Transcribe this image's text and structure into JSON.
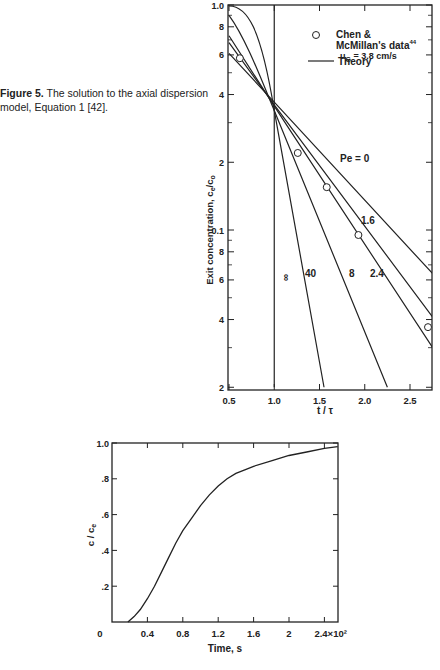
{
  "caption": {
    "label": "Figure 5.",
    "text": "The solution to the axial dispersion model, Equation 1 [42]."
  },
  "chart_data": [
    {
      "type": "line",
      "title": "",
      "xlabel": "t/τ",
      "ylabel": "Exit concentration, c_e/c_o",
      "xlim": [
        0.5,
        2.75
      ],
      "ylim": [
        0.02,
        1.0
      ],
      "yscale": "log",
      "x_ticks": [
        "0.5",
        "1.0",
        "1.5",
        "2.0",
        "2.5"
      ],
      "y_ticks": [
        "1.0",
        "8",
        "6",
        "4",
        "2",
        "0.1",
        "8",
        "6",
        "4",
        "2"
      ],
      "legend": {
        "marker_label": "Chen & McMillan's data",
        "marker_superscript": "44",
        "condition": "u_G = 3.8 cm/s",
        "line_label": "Theory"
      },
      "series": [
        {
          "name": "Pe=0",
          "label": "Pe = 0",
          "x": [
            0.5,
            1.0,
            2.75
          ],
          "y": [
            0.61,
            0.37,
            0.064
          ]
        },
        {
          "name": "Pe=1.6",
          "label": "1.6",
          "x": [
            0.5,
            1.0,
            2.75
          ],
          "y": [
            0.68,
            0.36,
            0.041
          ]
        },
        {
          "name": "Pe=2.4",
          "label": "2.4",
          "x": [
            0.5,
            1.0,
            2.75
          ],
          "y": [
            0.73,
            0.355,
            0.03
          ]
        },
        {
          "name": "Pe=8",
          "label": "8",
          "x": [
            0.5,
            1.0,
            2.25
          ],
          "y": [
            0.9,
            0.34,
            0.02
          ]
        },
        {
          "name": "Pe=40",
          "label": "40",
          "x": [
            0.5,
            0.8,
            1.0,
            1.55
          ],
          "y": [
            0.99,
            0.8,
            0.34,
            0.02
          ]
        },
        {
          "name": "Pe=inf",
          "label": "∞",
          "x": [
            1.0,
            1.0
          ],
          "y": [
            1.0,
            0.02
          ]
        }
      ],
      "data_points": {
        "name": "Chen & McMillan's data",
        "x": [
          0.62,
          1.26,
          1.58,
          1.93,
          2.72
        ],
        "y": [
          0.58,
          0.22,
          0.155,
          0.095,
          0.037
        ]
      }
    },
    {
      "type": "line",
      "title": "",
      "xlabel": "Time, s",
      "ylabel": "c/c_e",
      "xlim": [
        0,
        2.55
      ],
      "ylim": [
        0,
        1.0
      ],
      "x_ticks": [
        "0",
        "0.4",
        "0.8",
        "1.2",
        "1.6",
        "2",
        "2.4×10²"
      ],
      "y_ticks": [
        ".2",
        ".4",
        ".6",
        ".8",
        "1.0"
      ],
      "series": [
        {
          "name": "response",
          "x": [
            0.18,
            0.25,
            0.32,
            0.4,
            0.48,
            0.56,
            0.64,
            0.72,
            0.8,
            0.9,
            1.0,
            1.1,
            1.2,
            1.3,
            1.4,
            1.5,
            1.6,
            1.8,
            2.0,
            2.2,
            2.4,
            2.55
          ],
          "y": [
            0.0,
            0.03,
            0.07,
            0.13,
            0.2,
            0.28,
            0.36,
            0.44,
            0.51,
            0.58,
            0.65,
            0.71,
            0.76,
            0.8,
            0.83,
            0.85,
            0.87,
            0.9,
            0.93,
            0.95,
            0.97,
            0.98
          ]
        }
      ]
    }
  ]
}
